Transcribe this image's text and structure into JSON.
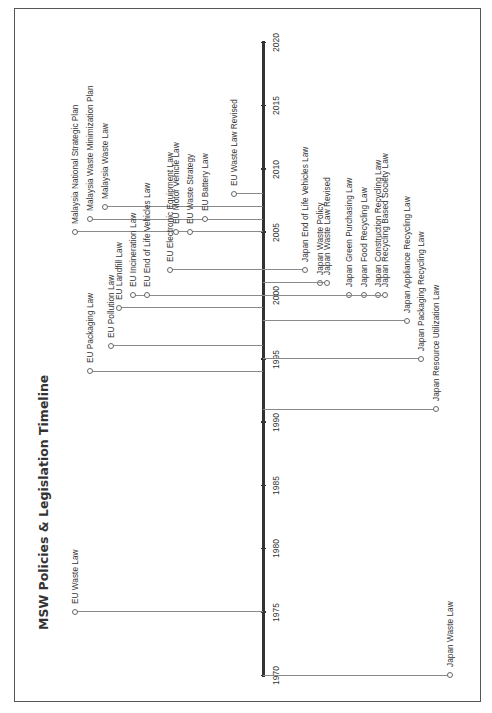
{
  "title": "MSW Policies & Legislation Timeline",
  "axis": {
    "start_year": 1970,
    "end_year": 2020,
    "ticks": [
      "1970",
      "1975",
      "1980",
      "1985",
      "1990",
      "1995",
      "2000",
      "2005",
      "2010",
      "2015",
      "2020"
    ]
  },
  "colors": {
    "axis": "#333333",
    "stem": "#8a8a8a",
    "frame": "#555555",
    "text": "#333333"
  },
  "events": {
    "left": [
      {
        "label": "Malaysia National Strategic Plan",
        "year": 2005,
        "depth": 75
      },
      {
        "label": "Malaysia Waste Minimization Plan",
        "year": 2006,
        "depth": 90
      },
      {
        "label": "Malaysia Waste Law",
        "year": 2007,
        "depth": 105
      },
      {
        "label": "EU Waste Law Revised",
        "year": 2008,
        "depth": 234
      },
      {
        "label": "EU Motor Vehicle Law",
        "year": 2005,
        "depth": 176
      },
      {
        "label": "EU Waste Strategy",
        "year": 2005,
        "depth": 190
      },
      {
        "label": "EU Battery Law",
        "year": 2006,
        "depth": 205
      },
      {
        "label": "EU Electronic Equipment Law",
        "year": 2002,
        "depth": 170
      },
      {
        "label": "EU Incineration Law",
        "year": 2000,
        "depth": 133
      },
      {
        "label": "EU End of Life Vehicles Law",
        "year": 2000,
        "depth": 147
      },
      {
        "label": "EU Landfill Law",
        "year": 1999,
        "depth": 119
      },
      {
        "label": "EU Pollution Law",
        "year": 1996,
        "depth": 111
      },
      {
        "label": "EU Packaging Law",
        "year": 1994,
        "depth": 90
      },
      {
        "label": "EU Waste Law",
        "year": 1975,
        "depth": 75
      }
    ],
    "right": [
      {
        "label": "Japan End of Life Vehicles Law",
        "year": 2002,
        "depth": 305
      },
      {
        "label": "Japan Waste Policy",
        "year": 2001,
        "depth": 320
      },
      {
        "label": "Japan Waste Law Revised",
        "year": 2001,
        "depth": 327
      },
      {
        "label": "Japan Green Purchasing Law",
        "year": 2000,
        "depth": 349
      },
      {
        "label": "Japan Food Recycling Law",
        "year": 2000,
        "depth": 364
      },
      {
        "label": "Japan Construction Recycling Law",
        "year": 2000,
        "depth": 378
      },
      {
        "label": "Japan Recycling Based Society Law",
        "year": 2000,
        "depth": 385
      },
      {
        "label": "Japan Appliance Recycling Law",
        "year": 1998,
        "depth": 407
      },
      {
        "label": "Japan Packaging Recycling Law",
        "year": 1995,
        "depth": 421
      },
      {
        "label": "Japan Resource Utilization Law",
        "year": 1991,
        "depth": 436
      },
      {
        "label": "Japan Waste Law",
        "year": 1970,
        "depth": 450
      }
    ]
  }
}
